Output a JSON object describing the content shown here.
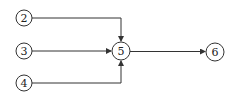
{
  "diagram": {
    "type": "directed-network",
    "nodes": [
      {
        "id": "2",
        "label": "2",
        "cx": 24,
        "cy": 18,
        "r": 8
      },
      {
        "id": "3",
        "label": "3",
        "cx": 24,
        "cy": 51,
        "r": 8
      },
      {
        "id": "4",
        "label": "4",
        "cx": 24,
        "cy": 83,
        "r": 8
      },
      {
        "id": "5",
        "label": "5",
        "cx": 121,
        "cy": 51,
        "r": 9
      },
      {
        "id": "6",
        "label": "6",
        "cx": 215,
        "cy": 52,
        "r": 9
      }
    ],
    "edges": [
      {
        "from": "2",
        "to": "5"
      },
      {
        "from": "3",
        "to": "5"
      },
      {
        "from": "4",
        "to": "5"
      },
      {
        "from": "5",
        "to": "6"
      }
    ],
    "colors": {
      "stroke": "#333333",
      "background": "#ffffff"
    }
  }
}
